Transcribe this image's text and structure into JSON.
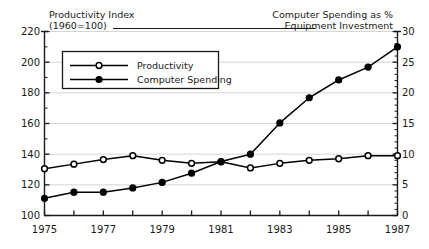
{
  "chart_data": {
    "type": "line",
    "title": "",
    "x": [
      1975,
      1976,
      1977,
      1978,
      1979,
      1980,
      1981,
      1982,
      1983,
      1984,
      1985,
      1986,
      1987
    ],
    "xtick_labels": [
      "1975",
      "",
      "1977",
      "",
      "1979",
      "",
      "1981",
      "",
      "1983",
      "",
      "1985",
      "",
      "1987"
    ],
    "xlabel": "",
    "xlim": [
      1975,
      1987
    ],
    "grid": true,
    "legend_position": "upper-left-inside",
    "left_axis": {
      "title_line1": "Productivity Index",
      "title_line2": "(1960=100)",
      "ylabel": "Productivity Index (1960=100)",
      "ylim": [
        100,
        220
      ],
      "ticks": [
        100,
        120,
        140,
        160,
        180,
        200,
        220
      ],
      "tick_labels": [
        "100",
        "120",
        "140",
        "160",
        "180",
        "200",
        "220"
      ],
      "minor_tick_step": 10
    },
    "right_axis": {
      "title_line1": "Computer Spending as %",
      "title_line2": "Equipment Investment",
      "ylabel": "Computer Spending as % Equipment Investment",
      "ylim": [
        0,
        30
      ],
      "ticks": [
        0,
        5,
        10,
        15,
        20,
        25,
        30
      ],
      "tick_labels": [
        "0",
        "5",
        "10",
        "15",
        "20",
        "25",
        "30"
      ],
      "minor_tick_step": 1
    },
    "series": [
      {
        "name": "Productivity",
        "axis": "left",
        "marker": "open-circle",
        "color": "#000000",
        "values": [
          130.5,
          133.5,
          136.5,
          139.0,
          136.0,
          134.0,
          135.0,
          131.0,
          134.0,
          136.0,
          137.0,
          139.0,
          139.0
        ]
      },
      {
        "name": "Computer Spending",
        "axis": "right",
        "marker": "filled-circle",
        "color": "#000000",
        "values": [
          2.8,
          3.8,
          3.8,
          4.5,
          5.4,
          6.9,
          8.8,
          10.0,
          15.1,
          19.2,
          22.1,
          24.2,
          27.5
        ]
      }
    ],
    "legend": [
      {
        "label": "Productivity",
        "marker": "open-circle"
      },
      {
        "label": "Computer Spending",
        "marker": "filled-circle"
      }
    ]
  },
  "colors": {
    "ink": "#1a1a1a",
    "line": "#000000",
    "grid": "#cccccc",
    "background": "#ffffff"
  }
}
